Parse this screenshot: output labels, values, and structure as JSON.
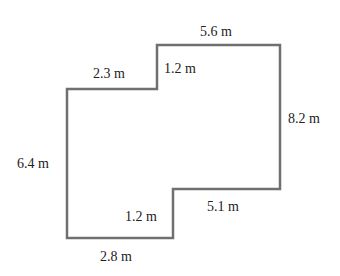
{
  "diagram": {
    "type": "floor-plan-polygon",
    "stroke_color": "#707070",
    "text_color": "#222222",
    "vertices_px": [
      [
        67,
        89
      ],
      [
        157,
        89
      ],
      [
        157,
        45
      ],
      [
        280,
        45
      ],
      [
        280,
        189
      ],
      [
        173,
        189
      ],
      [
        173,
        238
      ],
      [
        67,
        238
      ]
    ],
    "labels": [
      {
        "id": "top",
        "text": "5.6 m",
        "x": 200,
        "y": 25
      },
      {
        "id": "upper-left-top",
        "text": "2.3 m",
        "x": 93,
        "y": 67
      },
      {
        "id": "upper-step",
        "text": "1.2 m",
        "x": 164,
        "y": 62
      },
      {
        "id": "right",
        "text": "8.2 m",
        "x": 288,
        "y": 112
      },
      {
        "id": "left",
        "text": "6.4 m",
        "x": 17,
        "y": 157
      },
      {
        "id": "lower-right",
        "text": "5.1 m",
        "x": 207,
        "y": 200
      },
      {
        "id": "lower-step",
        "text": "1.2 m",
        "x": 125,
        "y": 210
      },
      {
        "id": "bottom",
        "text": "2.8 m",
        "x": 100,
        "y": 250
      }
    ]
  }
}
